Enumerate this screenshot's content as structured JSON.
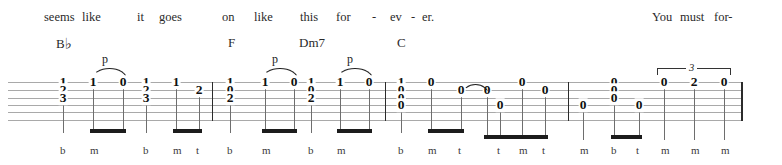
{
  "document": {
    "type": "guitar-tablature",
    "title": "Tablature staff system"
  },
  "lyrics": [
    {
      "text": "seems",
      "x": 44
    },
    {
      "text": "like",
      "x": 82
    },
    {
      "text": "it",
      "x": 137
    },
    {
      "text": "goes",
      "x": 159
    },
    {
      "text": "on",
      "x": 222
    },
    {
      "text": "like",
      "x": 254
    },
    {
      "text": "this",
      "x": 300
    },
    {
      "text": "for",
      "x": 336
    },
    {
      "text": "-",
      "x": 372
    },
    {
      "text": "ev",
      "x": 390
    },
    {
      "text": "-",
      "x": 411
    },
    {
      "text": "er.",
      "x": 422
    },
    {
      "text": "You",
      "x": 652
    },
    {
      "text": "must",
      "x": 680
    },
    {
      "text": "for-",
      "x": 714
    }
  ],
  "chords": [
    {
      "name": "B",
      "accidental": "♭",
      "x": 56
    },
    {
      "name": "F",
      "accidental": "",
      "x": 228
    },
    {
      "name": "Dm7",
      "accidental": "",
      "x": 299
    },
    {
      "name": "C",
      "accidental": "",
      "x": 397
    }
  ],
  "staff": {
    "line_count": 6,
    "line_color": "#a9a9a9",
    "left": 8,
    "right": 742,
    "string_y": [
      82,
      90,
      98,
      105,
      112,
      120
    ]
  },
  "barlines": [
    {
      "x": 212,
      "thick": false
    },
    {
      "x": 385,
      "thick": false
    },
    {
      "x": 568,
      "thick": false
    },
    {
      "x": 741,
      "thick": true
    }
  ],
  "notes": [
    {
      "fret": "1",
      "x": 63,
      "string": 1,
      "stem_to": 133,
      "finger": "b"
    },
    {
      "fret": "2",
      "x": 63,
      "string": 2,
      "stem_to": 0,
      "finger": ""
    },
    {
      "fret": "3",
      "x": 63,
      "string": 3,
      "stem_to": 0,
      "finger": ""
    },
    {
      "fret": "1",
      "x": 93,
      "string": 1,
      "stem_to": 129,
      "finger": "m"
    },
    {
      "fret": "0",
      "x": 123,
      "string": 1,
      "stem_to": 129,
      "finger": ""
    },
    {
      "fret": "1",
      "x": 146,
      "string": 1,
      "stem_to": 133,
      "finger": "b"
    },
    {
      "fret": "2",
      "x": 146,
      "string": 2,
      "stem_to": 0,
      "finger": ""
    },
    {
      "fret": "3",
      "x": 146,
      "string": 3,
      "stem_to": 0,
      "finger": ""
    },
    {
      "fret": "1",
      "x": 176,
      "string": 1,
      "stem_to": 129,
      "finger": "m"
    },
    {
      "fret": "2",
      "x": 199,
      "string": 2,
      "stem_to": 129,
      "finger": "t"
    },
    {
      "fret": "1",
      "x": 230,
      "string": 1,
      "stem_to": 133,
      "finger": "b"
    },
    {
      "fret": "0",
      "x": 230,
      "string": 2,
      "stem_to": 0,
      "finger": ""
    },
    {
      "fret": "2",
      "x": 230,
      "string": 3,
      "stem_to": 0,
      "finger": ""
    },
    {
      "fret": "1",
      "x": 265,
      "string": 1,
      "stem_to": 129,
      "finger": "m"
    },
    {
      "fret": "0",
      "x": 294,
      "string": 1,
      "stem_to": 129,
      "finger": ""
    },
    {
      "fret": "1",
      "x": 311,
      "string": 1,
      "stem_to": 133,
      "finger": "b"
    },
    {
      "fret": "0",
      "x": 311,
      "string": 2,
      "stem_to": 0,
      "finger": ""
    },
    {
      "fret": "2",
      "x": 311,
      "string": 3,
      "stem_to": 0,
      "finger": ""
    },
    {
      "fret": "1",
      "x": 340,
      "string": 1,
      "stem_to": 129,
      "finger": "m"
    },
    {
      "fret": "0",
      "x": 369,
      "string": 1,
      "stem_to": 129,
      "finger": ""
    },
    {
      "fret": "1",
      "x": 401,
      "string": 1,
      "stem_to": 133,
      "finger": "b"
    },
    {
      "fret": "0",
      "x": 401,
      "string": 2,
      "stem_to": 0,
      "finger": ""
    },
    {
      "fret": "0",
      "x": 401,
      "string": 3,
      "stem_to": 0,
      "finger": ""
    },
    {
      "fret": "0",
      "x": 401,
      "string": 4,
      "stem_to": 0,
      "finger": ""
    },
    {
      "fret": "0",
      "x": 431,
      "string": 1,
      "stem_to": 129,
      "finger": "m"
    },
    {
      "fret": "0",
      "x": 461,
      "string": 2,
      "stem_to": 129,
      "finger": "t"
    },
    {
      "fret": "0",
      "x": 487,
      "string": 2,
      "stem_to": 135,
      "finger": ""
    },
    {
      "fret": "0",
      "x": 500,
      "string": 4,
      "stem_to": 135,
      "finger": "t"
    },
    {
      "fret": "0",
      "x": 522,
      "string": 1,
      "stem_to": 135,
      "finger": "m"
    },
    {
      "fret": "0",
      "x": 545,
      "string": 2,
      "stem_to": 135,
      "finger": "t"
    },
    {
      "fret": "0",
      "x": 583,
      "string": 4,
      "stem_to": 140,
      "finger": "m"
    },
    {
      "fret": "0",
      "x": 614,
      "string": 1,
      "stem_to": 135,
      "finger": "b"
    },
    {
      "fret": "0",
      "x": 614,
      "string": 2,
      "stem_to": 0,
      "finger": ""
    },
    {
      "fret": "0",
      "x": 614,
      "string": 3,
      "stem_to": 0,
      "finger": ""
    },
    {
      "fret": "0",
      "x": 639,
      "string": 4,
      "stem_to": 135,
      "finger": "t"
    },
    {
      "fret": "0",
      "x": 664,
      "string": 1,
      "stem_to": 140,
      "finger": "m"
    },
    {
      "fret": "2",
      "x": 694,
      "string": 1,
      "stem_to": 140,
      "finger": "m"
    },
    {
      "fret": "0",
      "x": 724,
      "string": 1,
      "stem_to": 140,
      "finger": "m"
    }
  ],
  "beams": [
    {
      "x": 90,
      "width": 36,
      "y": 129
    },
    {
      "x": 173,
      "width": 29,
      "y": 129
    },
    {
      "x": 262,
      "width": 35,
      "y": 129
    },
    {
      "x": 337,
      "width": 35,
      "y": 129
    },
    {
      "x": 428,
      "width": 36,
      "y": 129
    },
    {
      "x": 484,
      "width": 64,
      "y": 135
    },
    {
      "x": 611,
      "width": 31,
      "y": 135
    }
  ],
  "articulations": [
    {
      "kind": "pull-off",
      "label": "p",
      "x": 92,
      "width": 33,
      "y": 68,
      "label_x": 102
    },
    {
      "kind": "pull-off",
      "label": "p",
      "x": 262,
      "width": 34,
      "y": 68,
      "label_x": 272
    },
    {
      "kind": "pull-off",
      "label": "p",
      "x": 337,
      "width": 34,
      "y": 68,
      "label_x": 347
    },
    {
      "kind": "tie",
      "label": "",
      "x": 462,
      "width": 25,
      "y": 84,
      "label_x": 0
    }
  ],
  "tuplets": [
    {
      "number": "3",
      "x": 657,
      "width": 72,
      "y": 68,
      "num_x": 686
    }
  ],
  "fingerings": [
    {
      "letter": "b",
      "x": 63
    },
    {
      "letter": "m",
      "x": 93
    },
    {
      "letter": "b",
      "x": 146
    },
    {
      "letter": "m",
      "x": 176
    },
    {
      "letter": "t",
      "x": 199
    },
    {
      "letter": "b",
      "x": 230
    },
    {
      "letter": "m",
      "x": 265
    },
    {
      "letter": "b",
      "x": 311
    },
    {
      "letter": "m",
      "x": 340
    },
    {
      "letter": "b",
      "x": 401
    },
    {
      "letter": "m",
      "x": 431
    },
    {
      "letter": "t",
      "x": 461
    },
    {
      "letter": "t",
      "x": 500
    },
    {
      "letter": "m",
      "x": 522
    },
    {
      "letter": "t",
      "x": 545
    },
    {
      "letter": "m",
      "x": 583
    },
    {
      "letter": "b",
      "x": 614
    },
    {
      "letter": "t",
      "x": 639
    },
    {
      "letter": "m",
      "x": 664
    },
    {
      "letter": "m",
      "x": 694
    },
    {
      "letter": "m",
      "x": 724
    }
  ]
}
